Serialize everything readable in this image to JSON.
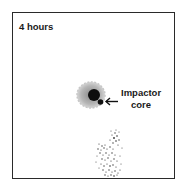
{
  "panel": {
    "time_label": "4 hours",
    "callout": {
      "line1": "Impactor",
      "line2": "core"
    }
  },
  "colors": {
    "frame": "#2a2a2a",
    "halo": "#a8a8a8",
    "core": "#0d0d0d",
    "debris": "#3a3a3a"
  }
}
